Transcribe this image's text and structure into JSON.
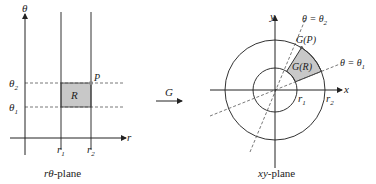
{
  "left_panel": {
    "caption_var": "rθ",
    "caption_rest": "-plane",
    "axis_vertical": "θ",
    "axis_horizontal": "r",
    "r1": {
      "base": "r",
      "sub": "1"
    },
    "r2": {
      "base": "r",
      "sub": "2"
    },
    "theta1": {
      "base": "θ",
      "sub": "1"
    },
    "theta2": {
      "base": "θ",
      "sub": "2"
    },
    "region_label": "R",
    "point_label": "P"
  },
  "mapping": {
    "label": "G"
  },
  "right_panel": {
    "caption_var": "xy",
    "caption_rest": "-plane",
    "axis_x": "x",
    "axis_y": "y",
    "r1": {
      "base": "r",
      "sub": "1"
    },
    "r2": {
      "base": "r",
      "sub": "2"
    },
    "ray1_label": {
      "lhs": "θ = θ",
      "sub": "1"
    },
    "ray2_label": {
      "lhs": "θ = θ",
      "sub": "2"
    },
    "region_label": "G(R)",
    "point_label": "G(P)"
  },
  "colors": {
    "shade": "#c8c8c8",
    "line": "#333333",
    "dashed": "#555555"
  }
}
